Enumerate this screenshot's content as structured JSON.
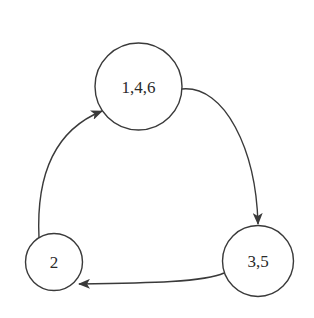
{
  "diagram": {
    "type": "state-cycle",
    "colors": {
      "stroke": "#3a3a3a",
      "text": "#2a2a2a",
      "background": "#ffffff"
    },
    "nodes": [
      {
        "id": "top",
        "label": "1,4,6",
        "cx": 138.5,
        "cy": 86.5,
        "r": 43.5
      },
      {
        "id": "right",
        "label": "3,5",
        "cx": 258,
        "cy": 261,
        "r": 35.5
      },
      {
        "id": "left",
        "label": "2",
        "cx": 54,
        "cy": 262,
        "r": 28.5
      }
    ],
    "edges": [
      {
        "from": "1,4,6",
        "to": "3,5"
      },
      {
        "from": "3,5",
        "to": "2"
      },
      {
        "from": "2",
        "to": "1,4,6"
      }
    ]
  }
}
